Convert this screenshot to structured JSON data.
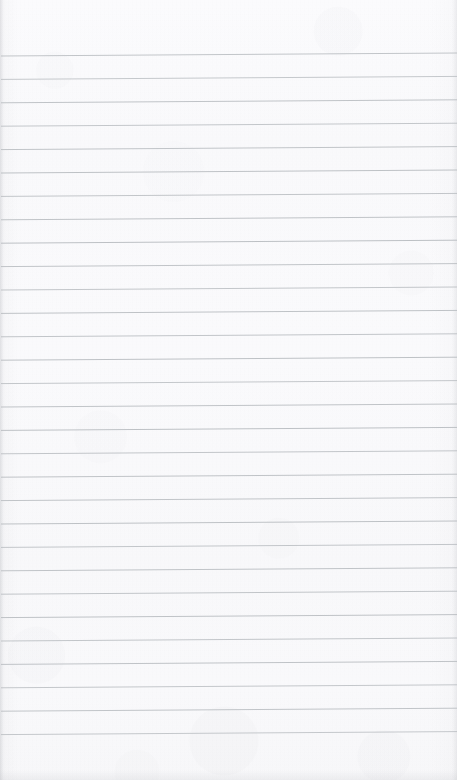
{
  "page": {
    "kind": "scanned-lined-notepad-page",
    "width": 457,
    "height": 780,
    "paper_color": "#fcfcfd",
    "paper_edge_shadow_color": "#b0b2b8",
    "written_content": "",
    "content_note": "blank ruled page — no handwriting, no printed text, no page number"
  },
  "ruling": {
    "line_color": "#b8bcc0",
    "line_thickness": 1,
    "line_count": 30,
    "first_line_y": 56,
    "line_spacing": 23.4,
    "left_x": 1,
    "right_x": 457,
    "skew_rise_px": 3,
    "top_margin": 56,
    "bottom_margin": 45,
    "lines": [
      {
        "index": 1,
        "y_left": 56.0,
        "y_right": 53.0,
        "opacity": 0.85
      },
      {
        "index": 2,
        "y_left": 79.4,
        "y_right": 76.4,
        "opacity": 0.8
      },
      {
        "index": 3,
        "y_left": 102.8,
        "y_right": 99.8,
        "opacity": 0.88
      },
      {
        "index": 4,
        "y_left": 126.2,
        "y_right": 123.2,
        "opacity": 0.82
      },
      {
        "index": 5,
        "y_left": 149.6,
        "y_right": 146.6,
        "opacity": 0.86
      },
      {
        "index": 6,
        "y_left": 173.0,
        "y_right": 170.0,
        "opacity": 0.9
      },
      {
        "index": 7,
        "y_left": 196.4,
        "y_right": 193.4,
        "opacity": 0.84
      },
      {
        "index": 8,
        "y_left": 219.8,
        "y_right": 216.8,
        "opacity": 0.88
      },
      {
        "index": 9,
        "y_left": 243.2,
        "y_right": 240.2,
        "opacity": 0.92
      },
      {
        "index": 10,
        "y_left": 266.6,
        "y_right": 263.6,
        "opacity": 0.86
      },
      {
        "index": 11,
        "y_left": 290.0,
        "y_right": 287.0,
        "opacity": 0.83
      },
      {
        "index": 12,
        "y_left": 313.4,
        "y_right": 310.4,
        "opacity": 0.89
      },
      {
        "index": 13,
        "y_left": 336.8,
        "y_right": 333.8,
        "opacity": 0.85
      },
      {
        "index": 14,
        "y_left": 360.2,
        "y_right": 357.2,
        "opacity": 0.9
      },
      {
        "index": 15,
        "y_left": 383.6,
        "y_right": 380.6,
        "opacity": 0.82
      },
      {
        "index": 16,
        "y_left": 407.0,
        "y_right": 404.0,
        "opacity": 0.87
      },
      {
        "index": 17,
        "y_left": 430.4,
        "y_right": 427.4,
        "opacity": 0.91
      },
      {
        "index": 18,
        "y_left": 453.8,
        "y_right": 450.8,
        "opacity": 0.84
      },
      {
        "index": 19,
        "y_left": 477.2,
        "y_right": 474.2,
        "opacity": 0.88
      },
      {
        "index": 20,
        "y_left": 500.6,
        "y_right": 497.6,
        "opacity": 0.86
      },
      {
        "index": 21,
        "y_left": 524.0,
        "y_right": 521.0,
        "opacity": 0.9
      },
      {
        "index": 22,
        "y_left": 547.4,
        "y_right": 544.4,
        "opacity": 0.83
      },
      {
        "index": 23,
        "y_left": 570.8,
        "y_right": 567.8,
        "opacity": 0.87
      },
      {
        "index": 24,
        "y_left": 594.2,
        "y_right": 591.2,
        "opacity": 0.85
      },
      {
        "index": 25,
        "y_left": 617.6,
        "y_right": 614.6,
        "opacity": 0.89
      },
      {
        "index": 26,
        "y_left": 641.0,
        "y_right": 638.0,
        "opacity": 0.84
      },
      {
        "index": 27,
        "y_left": 664.4,
        "y_right": 661.4,
        "opacity": 0.88
      },
      {
        "index": 28,
        "y_left": 687.8,
        "y_right": 684.8,
        "opacity": 0.82
      },
      {
        "index": 29,
        "y_left": 711.2,
        "y_right": 708.2,
        "opacity": 0.86
      },
      {
        "index": 30,
        "y_left": 734.6,
        "y_right": 731.6,
        "opacity": 0.8
      }
    ]
  }
}
